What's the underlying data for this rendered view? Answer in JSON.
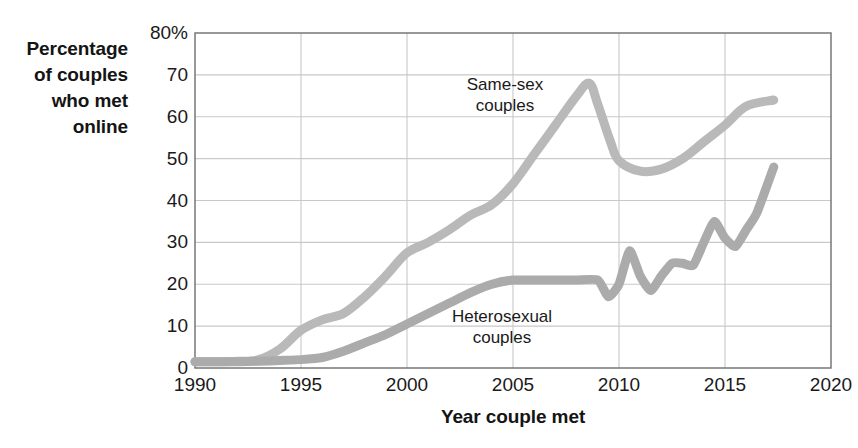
{
  "chart_data": {
    "type": "line",
    "title": "",
    "xlabel": "Year couple met",
    "ylabel": "Percentage of couples who met online",
    "ylabel_lines": [
      "Percentage",
      "of couples",
      "who met",
      "online"
    ],
    "xlim": [
      1990,
      2020
    ],
    "ylim": [
      0,
      80
    ],
    "grid": true,
    "legend_position": "in-plot annotations",
    "xticks": [
      1990,
      1995,
      2000,
      2005,
      2010,
      2015,
      2020
    ],
    "xtick_labels": [
      "1990",
      "1995",
      "2000",
      "2005",
      "2010",
      "2015",
      "2020"
    ],
    "yticks": [
      0,
      10,
      20,
      30,
      40,
      50,
      60,
      70,
      80
    ],
    "ytick_labels": [
      "0",
      "10",
      "20",
      "30",
      "40",
      "50",
      "60",
      "70",
      "80%"
    ],
    "colors": {
      "same_sex": "#b9b9b9",
      "heterosexual": "#ababab",
      "grid": "#c9c9c9",
      "axis": "#6e6e6e",
      "text": "#1a1a1a",
      "background": "#ffffff"
    },
    "series": [
      {
        "name": "Same-sex couples",
        "annotation_lines": [
          "Same-sex",
          "couples"
        ],
        "color": "#b9b9b9",
        "x": [
          1990,
          1991,
          1992,
          1993,
          1994,
          1995,
          1996,
          1997,
          1998,
          1999,
          2000,
          2001,
          2002,
          2003,
          2004,
          2005,
          2006,
          2007,
          2008,
          2008.6,
          2009,
          2009.6,
          2010,
          2011,
          2012,
          2013,
          2014,
          2015,
          2016,
          2017.3
        ],
        "values": [
          1.5,
          1.5,
          1.6,
          2.0,
          4.5,
          9.0,
          11.5,
          13.0,
          17.0,
          22.0,
          27.5,
          30.0,
          33.0,
          36.5,
          39.0,
          44.0,
          51.0,
          58.0,
          65.0,
          68.0,
          63.0,
          54.0,
          49.5,
          47.0,
          47.5,
          50.0,
          54.0,
          58.0,
          62.5,
          64.0
        ]
      },
      {
        "name": "Heterosexual couples",
        "annotation_lines": [
          "Heterosexual",
          "couples"
        ],
        "color": "#ababab",
        "x": [
          1990,
          1991,
          1992,
          1993,
          1994,
          1995,
          1996,
          1997,
          1998,
          1999,
          2000,
          2001,
          2002,
          2003,
          2004,
          2005,
          2006,
          2007,
          2008,
          2009,
          2009.5,
          2010,
          2010.5,
          2011,
          2011.5,
          2012,
          2012.5,
          2013,
          2013.5,
          2014,
          2014.5,
          2015,
          2015.5,
          2016,
          2016.5,
          2017.3
        ],
        "values": [
          1.5,
          1.5,
          1.5,
          1.6,
          1.8,
          2.0,
          2.5,
          4.0,
          6.0,
          8.0,
          10.5,
          13.0,
          15.5,
          18.0,
          20.0,
          21.0,
          21.0,
          21.0,
          21.0,
          21.0,
          17.0,
          20.0,
          28.0,
          22.0,
          18.5,
          22.0,
          25.0,
          25.0,
          24.5,
          30.0,
          35.0,
          31.0,
          29.0,
          33.0,
          37.0,
          48.0
        ]
      }
    ]
  },
  "plot_geometry": {
    "left": 195,
    "right": 831,
    "top": 33,
    "bottom": 368
  }
}
